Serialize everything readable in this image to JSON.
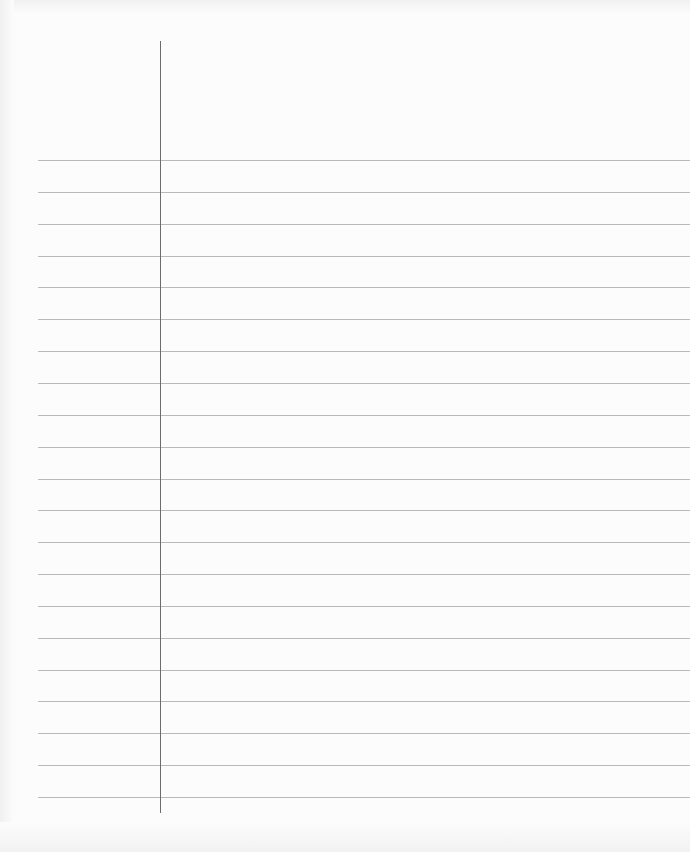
{
  "page": {
    "type": "blank lined notebook paper",
    "background_color": "#fcfcfc",
    "rule_color": "#b9b9b9",
    "margin_line_color": "#6c6c6c",
    "margin_line_x": 160,
    "margin_line_top": 41,
    "margin_line_bottom": 813,
    "rule_left": 38,
    "first_rule_y": 160,
    "rule_spacing": 31.85,
    "rule_count": 21
  }
}
